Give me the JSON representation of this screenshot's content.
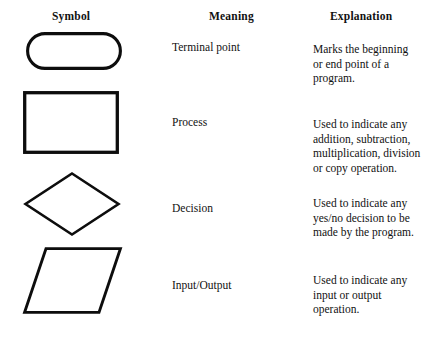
{
  "table": {
    "headers": {
      "symbol": "Symbol",
      "meaning": "Meaning",
      "explanation": "Explanation"
    },
    "rows": [
      {
        "shape": "terminal-rounded-rectangle",
        "meaning": "Terminal point",
        "explanation_lines": [
          "Marks the beginning",
          "or end point of a",
          "program."
        ]
      },
      {
        "shape": "process-rectangle",
        "meaning": "Process",
        "explanation_lines": [
          "Used to indicate any",
          "addition, subtraction,",
          "multiplication, division",
          "or copy operation."
        ]
      },
      {
        "shape": "decision-diamond",
        "meaning": "Decision",
        "explanation_lines": [
          "Used to indicate any",
          "yes/no decision to be",
          "made by the program."
        ]
      },
      {
        "shape": "input-output-parallelogram",
        "meaning": "Input/Output",
        "explanation_lines": [
          "Used to indicate any",
          "input or output",
          "operation."
        ]
      }
    ]
  },
  "style": {
    "page_background": "#ffffff",
    "ink_color": "#0d0d0d",
    "shape_fill": "#ffffff"
  }
}
